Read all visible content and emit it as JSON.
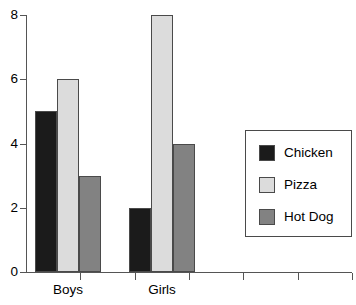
{
  "chart_data": {
    "type": "bar",
    "title": "",
    "subtitle": "",
    "xlabel": "",
    "ylabel": "",
    "categories": [
      "Boys",
      "Girls"
    ],
    "series": [
      {
        "name": "Chicken",
        "color": "#1b1b1b",
        "values": [
          5,
          2
        ]
      },
      {
        "name": "Pizza",
        "color": "#dcdcdc",
        "values": [
          6,
          8
        ]
      },
      {
        "name": "Hot Dog",
        "color": "#828282",
        "values": [
          3,
          4
        ]
      }
    ],
    "ylim": [
      0,
      8
    ],
    "y_ticks": [
      0,
      2,
      4,
      6,
      8
    ],
    "y_tick_labels": [
      "0",
      "2",
      "4",
      "6",
      "8"
    ],
    "x_tick_count": 6,
    "grid": false,
    "legend_position": "right-middle",
    "legend_entries": [
      "Chicken",
      "Pizza",
      "Hot Dog"
    ],
    "annotations": []
  },
  "axes": {
    "axis_color": "#555555",
    "bar_border_color": "#4a4a4a"
  }
}
